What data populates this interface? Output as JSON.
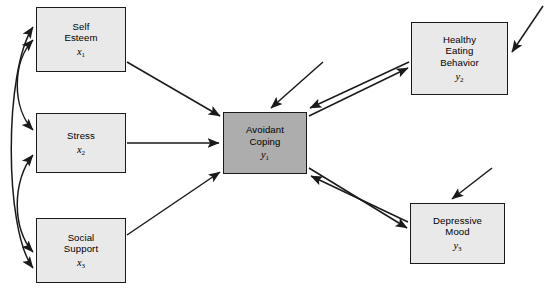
{
  "diagram": {
    "type": "path-diagram",
    "colors": {
      "exogenous_fill": "#e9e9e9",
      "focal_fill": "#adadad",
      "stroke": "#1a1a1a",
      "background": "#ffffff"
    },
    "nodes": [
      {
        "id": "self-esteem",
        "lines": [
          "Self",
          "Esteem"
        ],
        "symbol": "x",
        "subscript": "1",
        "role": "exogenous",
        "x": 36,
        "y": 7,
        "w": 90,
        "h": 65
      },
      {
        "id": "stress",
        "lines": [
          "Stress"
        ],
        "symbol": "x",
        "subscript": "2",
        "role": "exogenous",
        "x": 36,
        "y": 113,
        "w": 90,
        "h": 60
      },
      {
        "id": "social-support",
        "lines": [
          "Social",
          "Support"
        ],
        "symbol": "x",
        "subscript": "3",
        "role": "exogenous",
        "x": 36,
        "y": 218,
        "w": 90,
        "h": 65
      },
      {
        "id": "avoidant-coping",
        "lines": [
          "Avoidant",
          "Coping"
        ],
        "symbol": "y",
        "subscript": "1",
        "role": "focal",
        "x": 223,
        "y": 112,
        "w": 84,
        "h": 62
      },
      {
        "id": "healthy-eating-behavior",
        "lines": [
          "Healthy",
          "Eating",
          "Behavior"
        ],
        "symbol": "y",
        "subscript": "2",
        "role": "endogenous",
        "x": 411,
        "y": 22,
        "w": 97,
        "h": 73
      },
      {
        "id": "depressive-mood",
        "lines": [
          "Depressive",
          "Mood"
        ],
        "symbol": "y",
        "subscript": "3",
        "role": "endogenous",
        "x": 410,
        "y": 203,
        "w": 95,
        "h": 61
      }
    ],
    "paths": [
      {
        "id": "self-esteem-to-avoidant-coping",
        "from": "self-esteem",
        "to": "avoidant-coping",
        "kind": "directed"
      },
      {
        "id": "stress-to-avoidant-coping",
        "from": "stress",
        "to": "avoidant-coping",
        "kind": "directed"
      },
      {
        "id": "social-support-to-avoidant-coping",
        "from": "social-support",
        "to": "avoidant-coping",
        "kind": "directed"
      },
      {
        "id": "avoidant-coping-to-healthy-eating-behavior",
        "from": "avoidant-coping",
        "to": "healthy-eating-behavior",
        "kind": "directed"
      },
      {
        "id": "healthy-eating-behavior-to-avoidant-coping",
        "from": "healthy-eating-behavior",
        "to": "avoidant-coping",
        "kind": "directed"
      },
      {
        "id": "avoidant-coping-to-depressive-mood",
        "from": "avoidant-coping",
        "to": "depressive-mood",
        "kind": "directed"
      },
      {
        "id": "depressive-mood-to-avoidant-coping",
        "from": "depressive-mood",
        "to": "avoidant-coping",
        "kind": "directed"
      },
      {
        "id": "self-esteem-stress-covariance",
        "from": "self-esteem",
        "to": "stress",
        "kind": "covariance"
      },
      {
        "id": "stress-social-support-covariance",
        "from": "stress",
        "to": "social-support",
        "kind": "covariance"
      },
      {
        "id": "self-esteem-social-support-covariance",
        "from": "self-esteem",
        "to": "social-support",
        "kind": "covariance"
      },
      {
        "id": "disturbance-avoidant-coping",
        "to": "avoidant-coping",
        "kind": "disturbance"
      },
      {
        "id": "disturbance-healthy-eating-behavior",
        "to": "healthy-eating-behavior",
        "kind": "disturbance"
      },
      {
        "id": "disturbance-depressive-mood",
        "to": "depressive-mood",
        "kind": "disturbance"
      }
    ]
  }
}
